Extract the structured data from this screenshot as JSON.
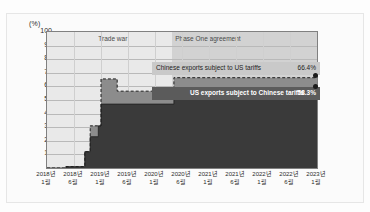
{
  "figure": {
    "unit_label": "(%)",
    "periods": [
      {
        "name": "trade-war",
        "label": "Trade war"
      },
      {
        "name": "phase-one",
        "label": "Phase One agreement"
      }
    ]
  },
  "callouts": {
    "top": {
      "label": "Chinese exports subject to US tariffs",
      "value": "66.4%"
    },
    "bottom": {
      "label": "US exports subject to Chinese tariffs",
      "value": "58.3%"
    }
  },
  "colors": {
    "upper_series": "#8c8c8c",
    "lower_series": "#3a3a3a",
    "plot_background": "#f2f2f2",
    "trade_war_band": "#e9e9e9",
    "phase_one_band": "#d2d2d2",
    "axis": "#808080",
    "gridline": "#b9b9b9"
  },
  "chart_data": {
    "type": "area",
    "title": "",
    "subtitle": "",
    "xlabel": "",
    "ylabel": "(%)",
    "ylim": [
      0,
      100
    ],
    "yticks": [
      0,
      10,
      20,
      30,
      40,
      50,
      60,
      70,
      80,
      90,
      100
    ],
    "grid": true,
    "legend": "inline-annotations",
    "xtick_labels": [
      "2018년\n1월",
      "2018년\n6월",
      "2019년\n1월",
      "2019년\n6월",
      "2020년\n1월",
      "2020년\n6월",
      "2021년\n1월",
      "2021년\n6월",
      "2022년\n1월",
      "2022년\n6월",
      "2023년\n1월"
    ],
    "xticks": [
      {
        "year": "2018년",
        "month": "1월"
      },
      {
        "year": "2018년",
        "month": "6월"
      },
      {
        "year": "2019년",
        "month": "1월"
      },
      {
        "year": "2019년",
        "month": "6월"
      },
      {
        "year": "2020년",
        "month": "1월"
      },
      {
        "year": "2020년",
        "month": "6월"
      },
      {
        "year": "2021년",
        "month": "1월"
      },
      {
        "year": "2021년",
        "month": "6월"
      },
      {
        "year": "2022년",
        "month": "1월"
      },
      {
        "year": "2022년",
        "month": "6월"
      },
      {
        "year": "2023년",
        "month": "1월"
      }
    ],
    "annotations": [
      {
        "text": "Trade war",
        "x_start": 0.0,
        "x_end": 0.463
      },
      {
        "text": "Phase One agreement",
        "x_start": 0.463,
        "x_end": 1.0
      }
    ],
    "series": [
      {
        "name": "Chinese exports subject to US tariffs",
        "style": "step-area-dashed-edge",
        "color": "#8c8c8c",
        "final_value": 66.4,
        "steps": [
          {
            "x": 0.0,
            "y": 0.0
          },
          {
            "x": 0.07,
            "y": 1.0
          },
          {
            "x": 0.14,
            "y": 12.0
          },
          {
            "x": 0.16,
            "y": 31.0
          },
          {
            "x": 0.2,
            "y": 65.5
          },
          {
            "x": 0.26,
            "y": 56.5
          },
          {
            "x": 0.44,
            "y": 57.0
          },
          {
            "x": 0.47,
            "y": 66.4
          },
          {
            "x": 1.0,
            "y": 66.4
          }
        ]
      },
      {
        "name": "US exports subject to Chinese tariffs",
        "style": "step-area",
        "color": "#3a3a3a",
        "final_value": 58.3,
        "steps": [
          {
            "x": 0.0,
            "y": 0.0
          },
          {
            "x": 0.07,
            "y": 1.0
          },
          {
            "x": 0.14,
            "y": 12.0
          },
          {
            "x": 0.16,
            "y": 23.0
          },
          {
            "x": 0.19,
            "y": 31.0
          },
          {
            "x": 0.2,
            "y": 47.0
          },
          {
            "x": 0.44,
            "y": 47.0
          },
          {
            "x": 0.47,
            "y": 58.3
          },
          {
            "x": 1.0,
            "y": 58.3
          }
        ]
      }
    ]
  }
}
